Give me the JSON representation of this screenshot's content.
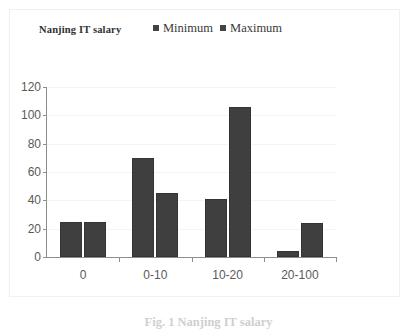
{
  "figure": {
    "caption": "Fig. 1  Nanjing IT salary"
  },
  "chart_data": {
    "type": "bar",
    "title": "Nanjing IT salary",
    "xlabel": "",
    "ylabel": "",
    "categories": [
      "0",
      "0-10",
      "10-20",
      "20-100"
    ],
    "series": [
      {
        "name": "Minimum",
        "values": [
          25,
          70,
          41,
          4
        ],
        "color": "#3f3f3f"
      },
      {
        "name": "Maximum",
        "values": [
          25,
          45,
          106,
          24
        ],
        "color": "#3f3f3f"
      }
    ],
    "ylim": [
      0,
      120
    ],
    "yticks": [
      0,
      20,
      40,
      60,
      80,
      100,
      120
    ],
    "ytick_labels": [
      "0",
      "20",
      "40",
      "60",
      "80",
      "100",
      "120"
    ],
    "grid": true,
    "legend_position": "top-center"
  },
  "legend": {
    "items": [
      {
        "label": "Minimum",
        "swatch": "legend-swatch-minimum"
      },
      {
        "label": "Maximum",
        "swatch": "legend-swatch-maximum"
      }
    ]
  }
}
